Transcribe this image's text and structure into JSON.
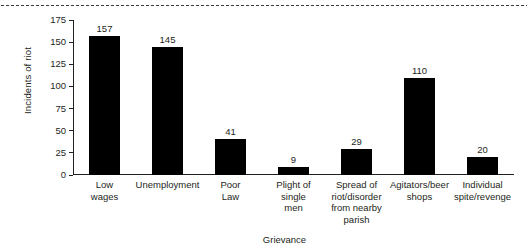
{
  "chart_data": {
    "type": "bar",
    "title": "",
    "xlabel": "Grievance",
    "ylabel": "Incidents of riot",
    "categories": [
      "Low\nwages",
      "Unemployment",
      "Poor\nLaw",
      "Plight of\nsingle\nmen",
      "Spread of\nriot/disorder\nfrom nearby\nparish",
      "Agitators/beer\nshops",
      "Individual\nspite/revenge"
    ],
    "values": [
      157,
      145,
      41,
      9,
      29,
      110,
      20
    ],
    "value_labels": [
      "157",
      "145",
      "41",
      "9",
      "29",
      "110",
      "20"
    ],
    "ylim": [
      0,
      175
    ],
    "yticks": [
      0,
      25,
      50,
      75,
      100,
      125,
      150,
      175
    ],
    "ytick_labels": [
      "0",
      "25",
      "50",
      "75",
      "100",
      "125",
      "150",
      "175"
    ],
    "grid": false,
    "legend": false,
    "bar_color": "#000000",
    "axis_color": "#231f20",
    "background": "#ffffff"
  },
  "decorations": {
    "top_rule": "dotted-rule"
  }
}
